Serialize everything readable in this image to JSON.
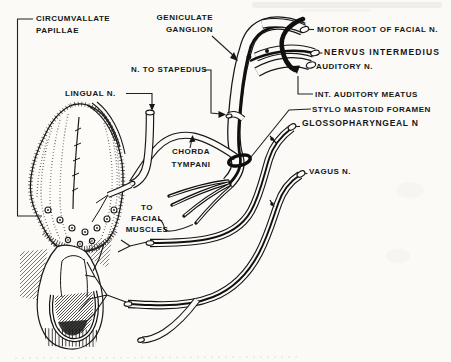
{
  "colors": {
    "ink": "#161616",
    "paper": "#fbfaf7"
  },
  "labels": {
    "circumvallate": {
      "lines": [
        "CIRCUMVALLATE",
        "PAPILLAE"
      ]
    },
    "geniculate": {
      "lines": [
        "GENICULATE",
        "GANGLION"
      ]
    },
    "stapedius": {
      "text": "N. TO STAPEDIUS"
    },
    "lingual": {
      "text": "LINGUAL N."
    },
    "motor_root": {
      "text": "MOTOR ROOT OF FACIAL N."
    },
    "nervus_intermedius": {
      "text": "NERVUS INTERMEDIUS"
    },
    "auditory": {
      "text": "AUDITORY N."
    },
    "int_auditory_meatus": {
      "text": "INT. AUDITORY MEATUS"
    },
    "stylo_mastoid": {
      "text": "STYLO MASTOID FORAMEN"
    },
    "glossopharyngeal": {
      "text": "GLOSSOPHARYNGEAL N"
    },
    "vagus": {
      "text": "VAGUS N."
    },
    "chorda_tympani": {
      "lines": [
        "CHORDA",
        "TYMPANI"
      ]
    },
    "to_facial_muscles": {
      "lines": [
        "TO",
        "FACIAL",
        "MUSCLES"
      ]
    }
  }
}
